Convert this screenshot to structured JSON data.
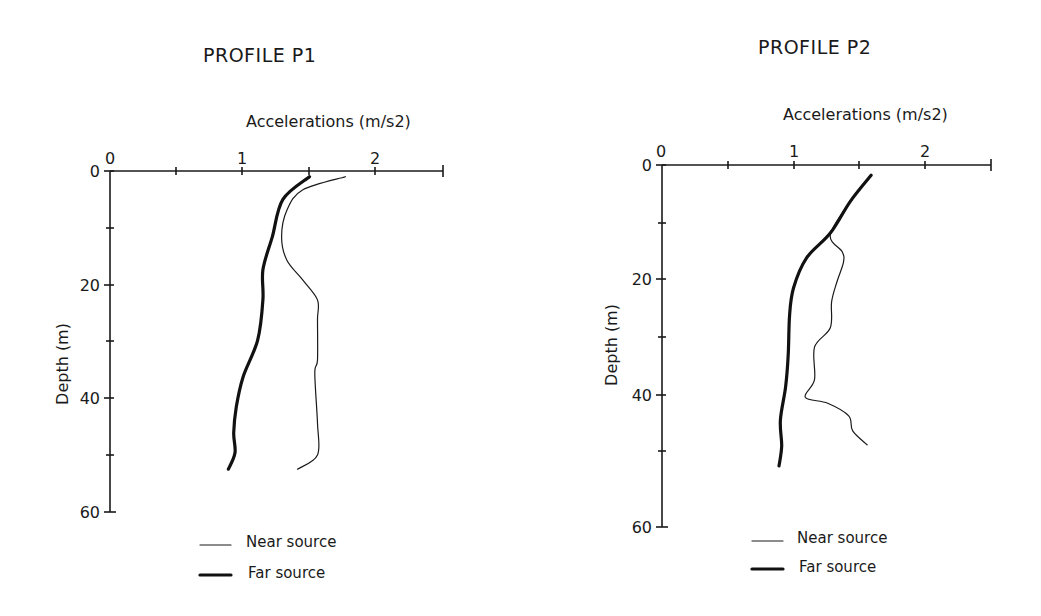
{
  "chart_data": [
    {
      "type": "line",
      "title": "PROFILE P1",
      "xlabel": "Accelerations (m/s2)",
      "ylabel": "Depth (m)",
      "xlim": [
        0,
        2.5
      ],
      "ylim": [
        60,
        0
      ],
      "x_ticks": [
        0,
        0.5,
        1,
        1.5,
        2,
        2.5
      ],
      "x_tick_labels": [
        "0",
        "1",
        "2"
      ],
      "y_ticks": [
        0,
        10,
        20,
        30,
        40,
        50,
        60
      ],
      "y_tick_labels": [
        "0",
        "20",
        "40",
        "60"
      ],
      "x_axis_position": "top",
      "grid": false,
      "legend_position": "bottom",
      "series": [
        {
          "name": "Near source",
          "style": "thin",
          "points": [
            [
              1.77,
              1
            ],
            [
              1.45,
              3.3
            ],
            [
              1.33,
              6.9
            ],
            [
              1.29,
              11.6
            ],
            [
              1.33,
              15.7
            ],
            [
              1.45,
              19.2
            ],
            [
              1.56,
              22.7
            ],
            [
              1.56,
              26.2
            ],
            [
              1.56,
              33.3
            ],
            [
              1.54,
              35.6
            ],
            [
              1.56,
              44.4
            ],
            [
              1.56,
              50
            ],
            [
              1.41,
              52.5
            ]
          ]
        },
        {
          "name": "Far source",
          "style": "thick",
          "points": [
            [
              1.5,
              1
            ],
            [
              1.3,
              5
            ],
            [
              1.22,
              11.6
            ],
            [
              1.15,
              17.4
            ],
            [
              1.15,
              22.7
            ],
            [
              1.11,
              29.8
            ],
            [
              1.0,
              36.3
            ],
            [
              0.95,
              41.5
            ],
            [
              0.93,
              46.1
            ],
            [
              0.94,
              49.6
            ],
            [
              0.89,
              52.5
            ]
          ]
        }
      ]
    },
    {
      "type": "line",
      "title": "PROFILE P2",
      "xlabel": "Accelerations (m/s2)",
      "ylabel": "Depth (m)",
      "xlim": [
        0,
        2.5
      ],
      "ylim": [
        60,
        0
      ],
      "x_ticks": [
        0,
        0.5,
        1,
        1.5,
        2,
        2.5
      ],
      "x_tick_labels": [
        "0",
        "1",
        "2"
      ],
      "y_ticks": [
        0,
        10,
        20,
        30,
        40,
        50,
        60
      ],
      "y_tick_labels": [
        "0",
        "20",
        "40",
        "60"
      ],
      "x_axis_position": "top",
      "grid": false,
      "legend_position": "bottom",
      "series": [
        {
          "name": "Near source",
          "style": "thin",
          "points": [
            [
              1.59,
              1.7
            ],
            [
              1.43,
              6.1
            ],
            [
              1.28,
              11.6
            ],
            [
              1.37,
              14.4
            ],
            [
              1.38,
              16.1
            ],
            [
              1.33,
              19.4
            ],
            [
              1.29,
              22.7
            ],
            [
              1.28,
              27.0
            ],
            [
              1.16,
              30.2
            ],
            [
              1.16,
              35.6
            ],
            [
              1.09,
              38.5
            ],
            [
              1.26,
              39.5
            ],
            [
              1.42,
              41.6
            ],
            [
              1.45,
              44.1
            ],
            [
              1.56,
              46.4
            ]
          ]
        },
        {
          "name": "Far source",
          "style": "thick",
          "points": [
            [
              1.59,
              1.7
            ],
            [
              1.43,
              6.1
            ],
            [
              1.28,
              11.3
            ],
            [
              1.1,
              15.4
            ],
            [
              1.0,
              20.4
            ],
            [
              0.97,
              24.9
            ],
            [
              0.96,
              31.5
            ],
            [
              0.94,
              36.8
            ],
            [
              0.9,
              42.3
            ],
            [
              0.91,
              46.6
            ],
            [
              0.89,
              49.9
            ]
          ]
        }
      ]
    }
  ],
  "panels": [
    {
      "title": "PROFILE P1",
      "xlabel": "Accelerations (m/s2)",
      "ylabel": "Depth (m)",
      "x_tick_labels": [
        "0",
        "1",
        "2"
      ],
      "y_tick_labels": [
        "0",
        "20",
        "40",
        "60"
      ],
      "legend": {
        "near": "Near source",
        "far": "Far source"
      }
    },
    {
      "title": "PROFILE P2",
      "xlabel": "Accelerations (m/s2)",
      "ylabel": "Depth (m)",
      "x_tick_labels": [
        "0",
        "1",
        "2"
      ],
      "y_tick_labels": [
        "0",
        "20",
        "40",
        "60"
      ],
      "legend": {
        "near": "Near source",
        "far": "Far source"
      }
    }
  ],
  "colors": {
    "ink": "#1a1a1a",
    "background": "#ffffff"
  }
}
